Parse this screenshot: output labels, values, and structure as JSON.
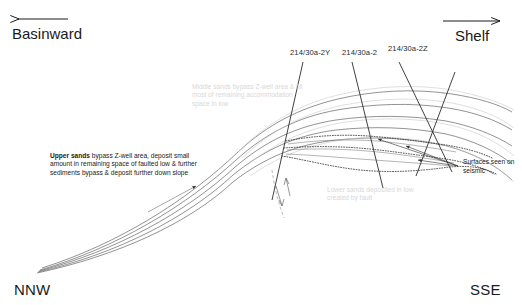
{
  "figure": {
    "orientation": {
      "left_corner": "NNW",
      "right_corner": "SSE",
      "left_direction": "Basinward",
      "right_direction": "Shelf"
    }
  },
  "wells": [
    {
      "id": "well-2Y",
      "label": "214/30a-2Y"
    },
    {
      "id": "well-2",
      "label": "214/30a-2"
    },
    {
      "id": "well-2Z",
      "label": "214/30a-2Z"
    }
  ],
  "annotations": {
    "upper_sands": {
      "lead": "Upper sands",
      "body": " bypass Z-well area, deposit small amount in remaining space of faulted low & further sediments bypass & deposit further down slope"
    },
    "middle_sands": {
      "text": "Middle sands bypass Z-well area & fill most of remaining accommodation space in low"
    },
    "lower_sands": {
      "text": "Lower sands deposited in low created by fault"
    },
    "seismic": {
      "text": "Surfaces seen on seismic"
    }
  },
  "colors": {
    "line": "#4a4a4a",
    "line_dark": "#2b2b2b",
    "faded_text": "#d8d8d8",
    "text": "#1a1a1a",
    "background": "#ffffff"
  }
}
